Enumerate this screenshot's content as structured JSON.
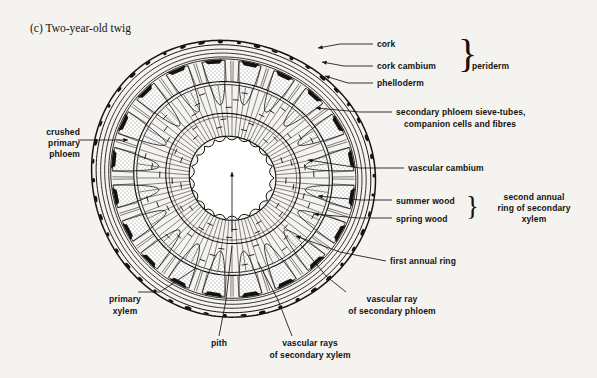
{
  "figure": {
    "title": "(c) Two-year-old twig",
    "kind": "botanical-cross-section-diagram",
    "background_color": "#f4f3f0",
    "ink_color": "#15120f"
  },
  "labels": {
    "cork": "cork",
    "cork_cambium": "cork cambium",
    "phelloderm": "phelloderm",
    "periderm": "periderm",
    "secondary_phloem_l1": "secondary phloem sieve-tubes,",
    "secondary_phloem_l2": "companion cells and fibres",
    "vascular_cambium": "vascular cambium",
    "summer_wood": "summer wood",
    "spring_wood": "spring wood",
    "second_annual_l1": "second annual",
    "second_annual_l2": "ring of secondary",
    "second_annual_l3": "xylem",
    "first_annual_ring": "first annual ring",
    "crushed_l1": "crushed",
    "crushed_l2": "primary",
    "crushed_l3": "phloem",
    "primary_xylem_l1": "primary",
    "primary_xylem_l2": "xylem",
    "pith": "pith",
    "vascular_rays_xylem_l1": "vascular rays",
    "vascular_rays_xylem_l2": "of secondary xylem",
    "vascular_ray_phloem_l1": "vascular ray",
    "vascular_ray_phloem_l2": "of secondary phloem"
  },
  "braces": {
    "periderm_brace": "}",
    "annual_ring_brace": "}"
  },
  "geometry": {
    "center_x": 232,
    "center_y": 178,
    "outer_radius": 140,
    "bark_rings": [
      140,
      135.5,
      131,
      127,
      123
    ],
    "phloem_wedge_count": 20,
    "phloem_outer_radius": 121,
    "phloem_inner_radius": 74,
    "cambium_radius": 98,
    "second_annual_ring_radius": 95,
    "first_annual_ring_radius": 66,
    "xylem_outer_radius": 95,
    "pith_radius": 42,
    "pith_scallop_count": 22,
    "ray_count": 84
  }
}
